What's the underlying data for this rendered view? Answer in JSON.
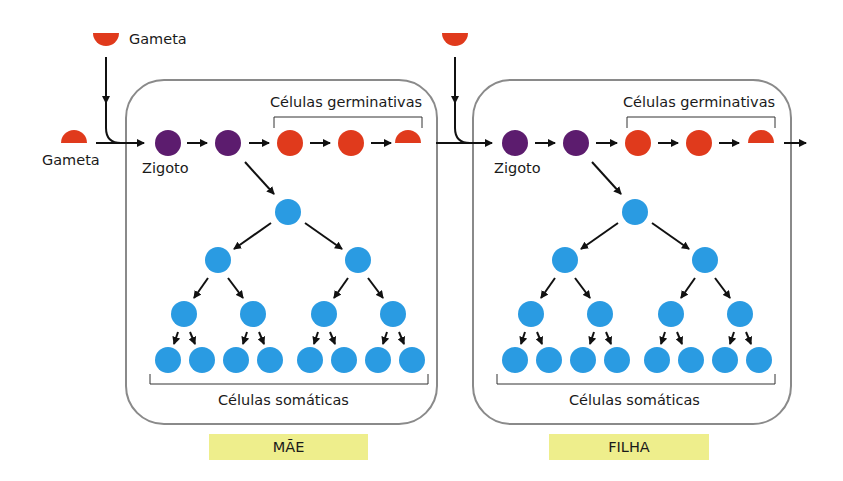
{
  "colors": {
    "gamete": "#e03a1c",
    "zygote": "#5c1c6e",
    "somatic": "#2a9be2",
    "box_border": "#8a8a8a",
    "tag_bg": "#eeee8c"
  },
  "labels": {
    "gamete_top": "Gameta",
    "gamete_left": "Gameta",
    "zygote": "Zigoto",
    "germ_cells": "Células germinativas",
    "somatic_cells": "Células somáticas"
  },
  "panels": [
    {
      "name": "mother",
      "label": "MÃE"
    },
    {
      "name": "daughter",
      "label": "FILHA"
    }
  ]
}
